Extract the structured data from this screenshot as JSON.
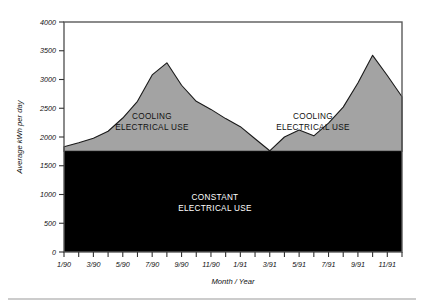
{
  "chart_data": {
    "type": "area",
    "title": "",
    "subtitle": "",
    "xlabel": "Month / Year",
    "ylabel": "Average kWh per day",
    "ylim": [
      0,
      4000
    ],
    "ytick_values": [
      0,
      500,
      1000,
      1500,
      2000,
      2500,
      3000,
      3500,
      4000
    ],
    "ytick_labels": [
      "0",
      "500",
      "1000",
      "1500",
      "2000",
      "2500",
      "3000",
      "3500",
      "4000"
    ],
    "grid": false,
    "legend_position": "none",
    "xtick_labels": [
      "1/90",
      "3/90",
      "5/90",
      "7/90",
      "9/90",
      "11/90",
      "1/91",
      "3/91",
      "5/91",
      "7/91",
      "9/91",
      "11/91"
    ],
    "x": [
      "1/90",
      "2/90",
      "3/90",
      "4/90",
      "5/90",
      "6/90",
      "7/90",
      "8/90",
      "9/90",
      "10/90",
      "11/90",
      "12/90",
      "1/91",
      "2/91",
      "3/91",
      "4/91",
      "5/91",
      "6/91",
      "7/91",
      "8/91",
      "9/91",
      "10/91",
      "11/91",
      "12/91"
    ],
    "series": [
      {
        "name": "CONSTANT ELECTRICAL USE",
        "fill_color": "#000000",
        "label_color": "#ffffff",
        "constant_value": 1750,
        "values": [
          1750,
          1750,
          1750,
          1750,
          1750,
          1750,
          1750,
          1750,
          1750,
          1750,
          1750,
          1750,
          1750,
          1750,
          1750,
          1750,
          1750,
          1750,
          1750,
          1750,
          1750,
          1750,
          1750,
          1750
        ]
      },
      {
        "name": "COOLING ELECTRICAL USE",
        "fill_color": "#a3a3a3",
        "label_color": "#111111",
        "values": [
          1830,
          1900,
          1980,
          2100,
          2330,
          2620,
          3080,
          3290,
          2900,
          2620,
          2480,
          2320,
          2180,
          1970,
          1760,
          2000,
          2120,
          2020,
          2240,
          2520,
          2940,
          3420,
          3070,
          2700
        ]
      }
    ],
    "annotations": [
      {
        "text_line1": "COOLING",
        "text_line2": "ELECTRICAL USE",
        "region": "cooling-left"
      },
      {
        "text_line1": "COOLING",
        "text_line2": "ELECTRICAL USE",
        "region": "cooling-right"
      },
      {
        "text_line1": "CONSTANT",
        "text_line2": "ELECTRICAL USE",
        "region": "constant"
      }
    ],
    "total_top_points": [
      [
        0,
        1830
      ],
      [
        1,
        1900
      ],
      [
        2,
        1980
      ],
      [
        3,
        2100
      ],
      [
        4,
        2330
      ],
      [
        5,
        2620
      ],
      [
        6,
        3080
      ],
      [
        7,
        3290
      ],
      [
        8,
        2900
      ],
      [
        9,
        2620
      ],
      [
        10,
        2480
      ],
      [
        11,
        2320
      ],
      [
        12,
        2180
      ],
      [
        13,
        1970
      ],
      [
        14,
        1760
      ],
      [
        15,
        2000
      ],
      [
        16,
        2120
      ],
      [
        17,
        2020
      ],
      [
        18,
        2240
      ],
      [
        19,
        2520
      ],
      [
        20,
        2940
      ],
      [
        21,
        3420
      ],
      [
        22,
        3070
      ],
      [
        23,
        2700
      ]
    ]
  },
  "figure": {
    "bottom_rule": true
  }
}
